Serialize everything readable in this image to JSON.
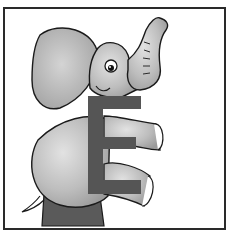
{
  "illustration": {
    "subject": "Cartoon elephant holding letter",
    "letter": "E",
    "colors": {
      "border": "#2a2a2a",
      "background": "#ffffff",
      "elephant_body": "#b8b8b8",
      "elephant_light": "#d6d6d6",
      "letter": "#555555",
      "outline": "#1a1a1a",
      "base": "#5a5a5a"
    }
  }
}
